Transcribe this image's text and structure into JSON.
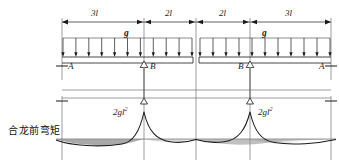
{
  "figure": {
    "title_caption": "合龙前弯矩",
    "dimensions": {
      "labels": [
        "3l",
        "2l",
        "2l",
        "3l"
      ],
      "spans": [
        3,
        2,
        2,
        3
      ],
      "unit_symbol": "l"
    },
    "loads": {
      "label_left": "g",
      "label_right": "g",
      "type": "uniform-distributed-load",
      "arrow_count_left": 11,
      "arrow_count_right": 11,
      "direction": "downward"
    },
    "nodes": {
      "left_end": "A",
      "left_support": "B",
      "right_support": "B",
      "right_end": "A"
    },
    "moment_diagram": {
      "peak_label_left": "2gl",
      "peak_exponent_left": "2",
      "peak_label_right": "2gl",
      "peak_exponent_right": "2",
      "peak_positions": [
        "B-left",
        "B-right"
      ],
      "baseline": "zero-moment-axis",
      "shape": "negative-cantilever-moment-peaks-at-supports"
    },
    "colors": {
      "line": "#1a1a1a",
      "fill": "#8c8c8c",
      "background": "#ffffff",
      "guide": "#555555"
    }
  }
}
